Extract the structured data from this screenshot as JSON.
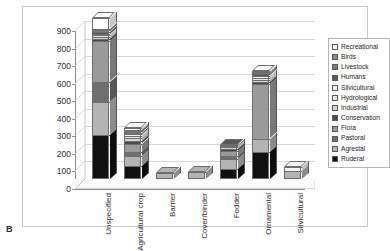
{
  "panel": {
    "label": "B"
  },
  "chart_data": {
    "type": "bar",
    "subtype": "stacked-bar-3d",
    "title": "",
    "xlabel": "",
    "ylabel": "",
    "ylim": [
      0,
      900
    ],
    "ytick_step": 100,
    "yticks": [
      0,
      100,
      200,
      300,
      400,
      500,
      600,
      700,
      800,
      900
    ],
    "grid": true,
    "legend_position": "right",
    "categories": [
      "Unspecified",
      "Agricultural crop",
      "Barrier",
      "Cover/binder",
      "Fodder",
      "Ornamental",
      "Silvicultural"
    ],
    "series": [
      {
        "name": "Ruderal",
        "color": "#111111",
        "values": [
          250,
          75,
          0,
          0,
          55,
          155,
          0
        ]
      },
      {
        "name": "Agrestal",
        "color": "#b4b4b4",
        "values": [
          190,
          55,
          35,
          38,
          60,
          75,
          48
        ]
      },
      {
        "name": "Pastoral",
        "color": "#6f6f6f",
        "values": [
          115,
          22,
          0,
          0,
          18,
          0,
          0
        ]
      },
      {
        "name": "Flora",
        "color": "#9a9a9a",
        "values": [
          230,
          50,
          0,
          0,
          28,
          310,
          0
        ]
      },
      {
        "name": "Conservation",
        "color": "#4a4a4a",
        "values": [
          12,
          14,
          0,
          0,
          10,
          12,
          0
        ]
      },
      {
        "name": "Industrial",
        "color": "#d4d4d4",
        "values": [
          14,
          16,
          0,
          0,
          10,
          14,
          0
        ]
      },
      {
        "name": "Hydrological",
        "color": "#e8e8e8",
        "values": [
          10,
          12,
          0,
          0,
          6,
          12,
          0
        ]
      },
      {
        "name": "Silvicultural",
        "color": "#f4f4f4",
        "values": [
          8,
          10,
          0,
          0,
          4,
          10,
          20
        ]
      },
      {
        "name": "Humans",
        "color": "#575757",
        "values": [
          10,
          10,
          0,
          0,
          4,
          8,
          0
        ]
      },
      {
        "name": "Livestock",
        "color": "#7d7d7d",
        "values": [
          8,
          8,
          0,
          0,
          0,
          6,
          0
        ]
      },
      {
        "name": "Birds",
        "color": "#8c8c8c",
        "values": [
          10,
          10,
          0,
          0,
          0,
          6,
          0
        ]
      },
      {
        "name": "Recreational",
        "color": "#ffffff",
        "values": [
          58,
          10,
          0,
          0,
          0,
          8,
          0
        ]
      }
    ],
    "totals": [
      915,
      292,
      35,
      38,
      195,
      616,
      68
    ]
  }
}
